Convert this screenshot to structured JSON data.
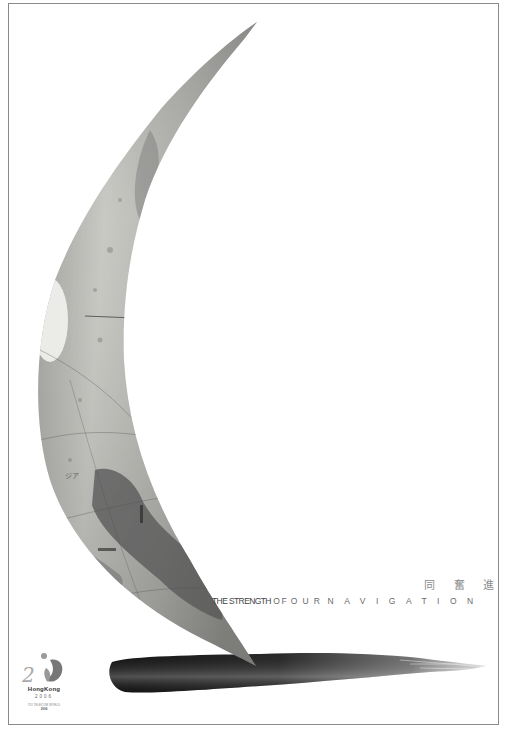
{
  "poster": {
    "chinese_title": [
      "同",
      "奮",
      "進"
    ],
    "tagline": {
      "part1": "THE STRENGTH",
      "part2": "OF",
      "part3": "OUR",
      "part4": "NAVIGATION"
    },
    "logo": {
      "name": "HongKong",
      "year": "2006",
      "subtitle": "ITU TELECOM WORLD",
      "subtitle2": "2006"
    },
    "colors": {
      "background": "#ffffff",
      "frame": "#8a8a8a",
      "globe_light": "#c8c8c4",
      "globe_dark": "#555555",
      "ink": "#1e1e1e",
      "text": "#6a6a6a"
    }
  }
}
